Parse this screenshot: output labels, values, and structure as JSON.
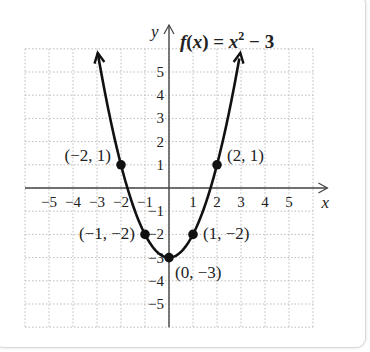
{
  "chart_data": {
    "type": "line",
    "title_parts": {
      "f": "f",
      "x": "x",
      "rest": ") = ",
      "base": "x",
      "exp": "2",
      "tail": " − 3"
    },
    "xlabel": "x",
    "ylabel": "y",
    "xlim": [
      -6,
      6
    ],
    "ylim": [
      -6,
      6
    ],
    "grid": true,
    "x_ticks": [
      "−5",
      "−4",
      "−3",
      "−2",
      "−1",
      "1",
      "2",
      "3",
      "4",
      "5"
    ],
    "x_tick_values": [
      -5,
      -4,
      -3,
      -2,
      -1,
      1,
      2,
      3,
      4,
      5
    ],
    "y_ticks": [
      "5",
      "4",
      "3",
      "2",
      "1",
      "−1",
      "−2",
      "−3",
      "−4",
      "−5"
    ],
    "y_tick_values": [
      5,
      4,
      3,
      2,
      1,
      -1,
      -2,
      -3,
      -4,
      -5
    ],
    "points": [
      {
        "x": -2,
        "y": 1,
        "label": "(−2, 1)"
      },
      {
        "x": -1,
        "y": -2,
        "label": "(−1, −2)"
      },
      {
        "x": 0,
        "y": -3,
        "label": "(0, −3)"
      },
      {
        "x": 1,
        "y": -2,
        "label": "(1, −2)"
      },
      {
        "x": 2,
        "y": 1,
        "label": "(2, 1)"
      }
    ],
    "series": [
      {
        "name": "f(x) = x^2 - 3",
        "function": "x^2 - 3",
        "x_range": [
          -2.97,
          2.97
        ]
      }
    ]
  }
}
